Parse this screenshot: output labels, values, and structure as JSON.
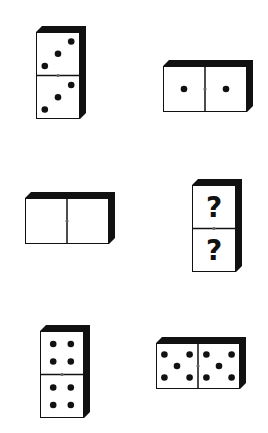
{
  "puzzle": {
    "type": "domino-sequence",
    "colors": {
      "face": "#ffffff",
      "edge": "#111111",
      "pip": "#111111",
      "divider_dot": "#666666"
    },
    "dominoes": [
      {
        "id": "d1",
        "orientation": "vertical",
        "halves": [
          3,
          3
        ],
        "x": 36,
        "y": 26,
        "label": "3|3"
      },
      {
        "id": "d2",
        "orientation": "horizontal",
        "halves": [
          1,
          1
        ],
        "x": 163,
        "y": 60,
        "label": "1|1"
      },
      {
        "id": "d3",
        "orientation": "horizontal",
        "halves": [
          0,
          0
        ],
        "x": 25,
        "y": 192,
        "label": "0|0"
      },
      {
        "id": "d4",
        "orientation": "vertical",
        "halves": [
          "?",
          "?"
        ],
        "x": 192,
        "y": 179,
        "label": "?|?"
      },
      {
        "id": "d5",
        "orientation": "vertical",
        "halves": [
          4,
          4
        ],
        "x": 40,
        "y": 325,
        "label": "4|4"
      },
      {
        "id": "d6",
        "orientation": "horizontal",
        "halves": [
          5,
          5
        ],
        "x": 156,
        "y": 337,
        "label": "5|5"
      }
    ],
    "question_mark": "?"
  }
}
